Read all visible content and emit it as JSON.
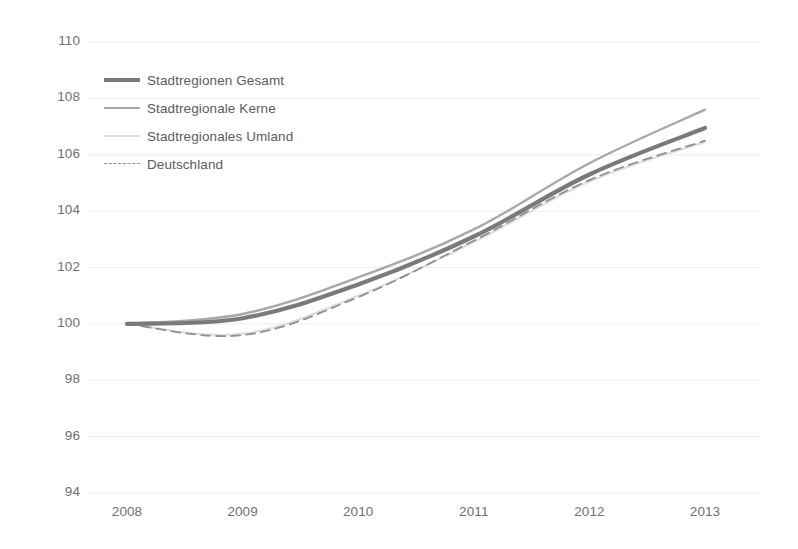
{
  "chart_data": {
    "type": "line",
    "title": "",
    "subtitle": "",
    "xlabel": "",
    "ylabel": "",
    "x": [
      "2008",
      "2009",
      "2010",
      "2011",
      "2012",
      "2013"
    ],
    "categories": [
      "2008",
      "2009",
      "2010",
      "2011",
      "2012",
      "2013"
    ],
    "xlim": [
      "2008",
      "2013"
    ],
    "ylim": [
      94,
      110
    ],
    "yticks": [
      94,
      96,
      98,
      100,
      102,
      104,
      106,
      108,
      110
    ],
    "xticks": [
      "2008",
      "2009",
      "2010",
      "2011",
      "2012",
      "2013"
    ],
    "grid": "horizontal",
    "legend_position": "upper-left-inside",
    "series": [
      {
        "name": "Stadtregionen Gesamt",
        "values": [
          100.0,
          100.2,
          101.4,
          103.1,
          105.3,
          106.95
        ],
        "color": "#7a7a7a",
        "style": "solid",
        "width": 4.2
      },
      {
        "name": "Stadtregionale Kerne",
        "values": [
          100.0,
          100.35,
          101.65,
          103.35,
          105.7,
          107.6
        ],
        "color": "#a8a8a8",
        "style": "solid",
        "width": 2.4
      },
      {
        "name": "Stadtregionales Umland",
        "values": [
          100.0,
          99.65,
          101.0,
          102.9,
          105.05,
          106.45
        ],
        "color": "#dcdcdc",
        "style": "solid",
        "width": 2.0
      },
      {
        "name": "Deutschland",
        "values": [
          100.0,
          99.6,
          100.95,
          102.95,
          105.1,
          106.5
        ],
        "color": "#8f8f8f",
        "style": "dashed",
        "width": 1.8
      }
    ]
  },
  "legend": {
    "items": [
      {
        "label": "Stadtregionen Gesamt"
      },
      {
        "label": "Stadtregionale Kerne"
      },
      {
        "label": "Stadtregionales Umland"
      },
      {
        "label": "Deutschland"
      }
    ]
  },
  "axis": {
    "y_tick_labels": [
      "110",
      "108",
      "106",
      "104",
      "102",
      "100",
      "98",
      "96",
      "94"
    ],
    "x_tick_labels": [
      "2008",
      "2009",
      "2010",
      "2011",
      "2012",
      "2013"
    ]
  },
  "colors": {
    "grid": "#ececec",
    "axis_text": "#6f6f6f",
    "legend_text": "#5b5b5b",
    "background": "#ffffff",
    "series_gesamt": "#7a7a7a",
    "series_kerne": "#a8a8a8",
    "series_umland": "#dcdcdc",
    "series_deutschland": "#8f8f8f"
  }
}
